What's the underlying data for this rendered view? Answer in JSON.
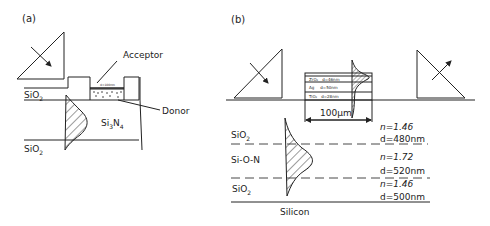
{
  "panel_a": {
    "label": "(a)",
    "acceptor_label": "Acceptor",
    "donor_label": "Donor",
    "sio2_top": "SiO",
    "sio2_top_sub": "2",
    "si3n4_a": "Si",
    "si3n4_sub1": "3",
    "si3n4_b": "N",
    "si3n4_sub2": "4",
    "sio2_bottom": "SiO",
    "sio2_bottom_sub": "2"
  },
  "panel_b": {
    "label": "(b)",
    "stack_layers": [
      {
        "material": "ZrO₂",
        "thickness": "d=46nm"
      },
      {
        "material": "Ag",
        "thickness": "d=50nm"
      },
      {
        "material": "TiO₂",
        "thickness": "d=28nm"
      }
    ],
    "width_label": "100µm",
    "layers": [
      {
        "name": "SiO",
        "sub": "2",
        "n": "n=1.46",
        "d": "d=480nm"
      },
      {
        "name": "Si-O-N",
        "sub": "",
        "n": "n=1.72",
        "d": "d=520nm"
      },
      {
        "name": "SiO",
        "sub": "2",
        "n": "n=1.46",
        "d": "d=500nm"
      }
    ],
    "substrate": "Silicon"
  }
}
